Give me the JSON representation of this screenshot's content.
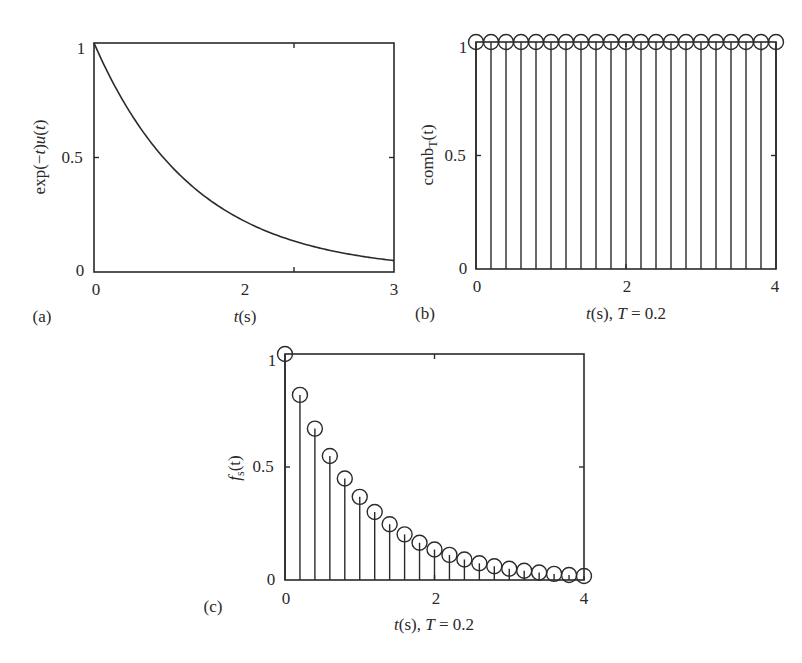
{
  "figure": {
    "panels": [
      {
        "id": "a",
        "tag": "(a)",
        "ylabel_parts": [
          "exp(−",
          "t",
          ")",
          "u",
          "(",
          "t",
          ")"
        ],
        "xlabel_parts": [
          "t",
          "(s)"
        ],
        "x_ticks": [
          "0",
          "2",
          "3"
        ],
        "y_ticks": [
          "0",
          "0.5",
          "1"
        ]
      },
      {
        "id": "b",
        "tag": "(b)",
        "ylabel_main": "comb",
        "ylabel_sub": "T",
        "ylabel_arg": "(t)",
        "xlabel_parts": [
          "t",
          "(s), ",
          "T",
          " = 0.2"
        ],
        "x_ticks": [
          "0",
          "2",
          "4"
        ],
        "y_ticks": [
          "0",
          "0.5",
          "1"
        ]
      },
      {
        "id": "c",
        "tag": "(c)",
        "ylabel_main": "f",
        "ylabel_sub": "s",
        "ylabel_arg": "(t)",
        "xlabel_parts": [
          "t",
          "(s), ",
          "T",
          " = 0.2"
        ],
        "x_ticks": [
          "0",
          "2",
          "4"
        ],
        "y_ticks": [
          "0",
          "0.5",
          "1"
        ]
      }
    ]
  },
  "chart_data": [
    {
      "type": "line",
      "panel": "(a)",
      "title": "",
      "xlabel": "t(s)",
      "ylabel": "exp(−t)u(t)",
      "xlim": [
        0,
        3
      ],
      "ylim": [
        0,
        1
      ],
      "xticks": [
        0,
        2,
        3
      ],
      "yticks": [
        0,
        0.5,
        1
      ],
      "grid": false,
      "function": "exp(-t)",
      "x": [
        0,
        0.25,
        0.5,
        0.75,
        1.0,
        1.25,
        1.5,
        1.75,
        2.0,
        2.25,
        2.5,
        2.75,
        3.0
      ],
      "y": [
        1.0,
        0.779,
        0.607,
        0.472,
        0.368,
        0.287,
        0.223,
        0.174,
        0.135,
        0.105,
        0.082,
        0.064,
        0.05
      ]
    },
    {
      "type": "stem",
      "panel": "(b)",
      "title": "",
      "xlabel": "t(s), T = 0.2",
      "ylabel": "comb_T(t)",
      "xlim": [
        0,
        4
      ],
      "ylim": [
        0,
        1
      ],
      "xticks": [
        0,
        2,
        4
      ],
      "yticks": [
        0,
        0.5,
        1
      ],
      "grid": false,
      "marker": "open-circle",
      "x": [
        0,
        0.2,
        0.4,
        0.6,
        0.8,
        1.0,
        1.2,
        1.4,
        1.6,
        1.8,
        2.0,
        2.2,
        2.4,
        2.6,
        2.8,
        3.0,
        3.2,
        3.4,
        3.6,
        3.8,
        4.0
      ],
      "y": [
        1,
        1,
        1,
        1,
        1,
        1,
        1,
        1,
        1,
        1,
        1,
        1,
        1,
        1,
        1,
        1,
        1,
        1,
        1,
        1,
        1
      ]
    },
    {
      "type": "stem",
      "panel": "(c)",
      "title": "",
      "xlabel": "t(s), T = 0.2",
      "ylabel": "f_s(t)",
      "xlim": [
        0,
        4
      ],
      "ylim": [
        0,
        1
      ],
      "xticks": [
        0,
        2,
        4
      ],
      "yticks": [
        0,
        0.5,
        1
      ],
      "grid": false,
      "marker": "open-circle",
      "x": [
        0,
        0.2,
        0.4,
        0.6,
        0.8,
        1.0,
        1.2,
        1.4,
        1.6,
        1.8,
        2.0,
        2.2,
        2.4,
        2.6,
        2.8,
        3.0,
        3.2,
        3.4,
        3.6,
        3.8,
        4.0
      ],
      "y": [
        1.0,
        0.819,
        0.67,
        0.549,
        0.449,
        0.368,
        0.301,
        0.247,
        0.202,
        0.165,
        0.135,
        0.111,
        0.091,
        0.074,
        0.061,
        0.05,
        0.041,
        0.033,
        0.027,
        0.022,
        0.018
      ]
    }
  ]
}
